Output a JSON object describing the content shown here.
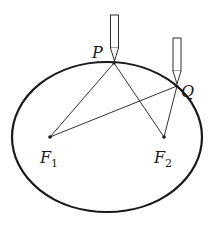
{
  "diagram": {
    "colors": {
      "stroke": "#1a1a1a",
      "background": "#ffffff"
    },
    "ellipse": {
      "cx": 107,
      "cy": 137,
      "rx": 95,
      "ry": 75
    },
    "points": {
      "P": {
        "label": "P",
        "x": 114,
        "y": 63
      },
      "Q": {
        "label": "Q",
        "x": 177,
        "y": 86
      },
      "F1": {
        "label": "F",
        "subscript": "1",
        "x": 50,
        "y": 137
      },
      "F2": {
        "label": "F",
        "subscript": "2",
        "x": 164,
        "y": 137
      }
    },
    "segments": [
      {
        "from": "F1",
        "to": "P"
      },
      {
        "from": "P",
        "to": "F2"
      },
      {
        "from": "F1",
        "to": "Q"
      },
      {
        "from": "Q",
        "to": "F2"
      }
    ],
    "pencils": [
      {
        "at": "P",
        "icon": "pencil-icon"
      },
      {
        "at": "Q",
        "icon": "pencil-icon"
      }
    ]
  }
}
